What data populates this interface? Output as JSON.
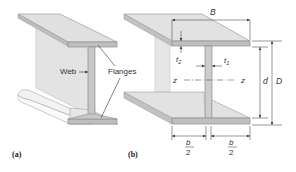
{
  "figure": {
    "panel_a": {
      "caption": "(a)",
      "labels": {
        "web": "Web",
        "flanges": "Flanges"
      }
    },
    "panel_b": {
      "caption": "(b)",
      "dimensions": {
        "flange_width": "B",
        "flange_thickness": "t",
        "flange_thickness_sub": "2",
        "web_thickness": "t",
        "web_thickness_sub": "1",
        "axis_left": "z",
        "axis_right": "z",
        "web_depth": "d",
        "total_depth": "D",
        "half_width_left_num": "b",
        "half_width_left_den": "2",
        "half_width_right_num": "b",
        "half_width_right_den": "2"
      }
    },
    "colors": {
      "steel_face": "#d9d9d9",
      "steel_edge": "#b3b3b3",
      "steel_light": "#ebebeb",
      "line": "#444444"
    }
  }
}
